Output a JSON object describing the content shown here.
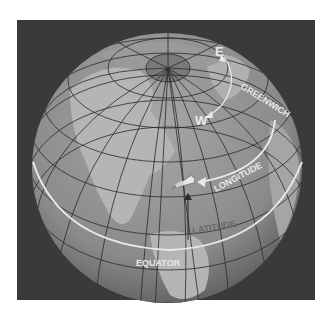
{
  "figure": {
    "colors": {
      "background": "#3a3a3a",
      "ocean": "#8a8a8a",
      "land": "#b5b5b5",
      "grid": "#2a2a2a",
      "highlight": "#e8e8e8"
    },
    "labels": {
      "east": "E",
      "west": "W",
      "greenwich": "GREENWICH",
      "longitude": "LONGITUDE",
      "latitude": "LATITUDE",
      "equator": "EQUATOR"
    }
  }
}
